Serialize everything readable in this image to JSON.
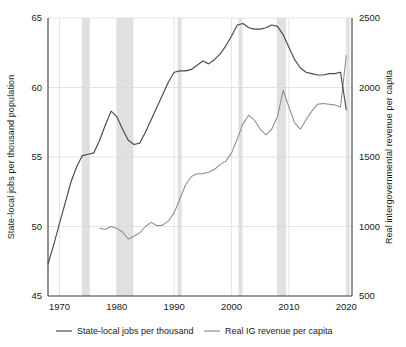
{
  "chart_data": {
    "type": "line",
    "title": "",
    "xlabel": "",
    "ylabel": "State-local jobs per thousand population",
    "y2label": "Real intergovernmental revenue per capita",
    "xlim": [
      1968,
      2021
    ],
    "ylim": [
      45,
      65
    ],
    "y2lim": [
      500,
      2500
    ],
    "grid": true,
    "legend_position": "bottom",
    "x_ticks": [
      1970,
      1980,
      1990,
      2000,
      2010,
      2020
    ],
    "y_ticks": [
      45,
      50,
      55,
      60,
      65
    ],
    "y2_ticks": [
      500,
      1000,
      1500,
      2000,
      2500
    ],
    "recession_bands": [
      {
        "start": 1973.9,
        "end": 1975.3
      },
      {
        "start": 1980.0,
        "end": 1982.9
      },
      {
        "start": 1990.6,
        "end": 1991.3
      },
      {
        "start": 2001.2,
        "end": 2001.9
      },
      {
        "start": 2007.9,
        "end": 2009.5
      },
      {
        "start": 2020.1,
        "end": 2020.6
      }
    ],
    "series": [
      {
        "name": "State-local jobs per thousand",
        "axis": "left",
        "color": "#4a4a4a",
        "x": [
          1968,
          1969,
          1970,
          1971,
          1972,
          1973,
          1974,
          1975,
          1976,
          1977,
          1978,
          1979,
          1980,
          1981,
          1982,
          1983,
          1984,
          1985,
          1986,
          1987,
          1988,
          1989,
          1990,
          1991,
          1992,
          1993,
          1994,
          1995,
          1996,
          1997,
          1998,
          1999,
          2000,
          2001,
          2002,
          2003,
          2004,
          2005,
          2006,
          2007,
          2008,
          2009,
          2010,
          2011,
          2012,
          2013,
          2014,
          2015,
          2016,
          2017,
          2018,
          2019,
          2020
        ],
        "values": [
          47.3,
          48.7,
          50.2,
          51.7,
          53.2,
          54.3,
          55.1,
          55.2,
          55.3,
          56.2,
          57.3,
          58.3,
          57.9,
          57.0,
          56.2,
          55.9,
          56.0,
          56.8,
          57.7,
          58.6,
          59.5,
          60.4,
          61.1,
          61.2,
          61.2,
          61.3,
          61.6,
          61.9,
          61.7,
          62.0,
          62.4,
          63.0,
          63.7,
          64.5,
          64.6,
          64.3,
          64.2,
          64.2,
          64.3,
          64.5,
          64.4,
          63.8,
          62.9,
          62.0,
          61.4,
          61.1,
          61.0,
          60.9,
          60.9,
          61.0,
          61.0,
          61.1,
          58.4
        ]
      },
      {
        "name": "Real IG revenue per capita",
        "axis": "right",
        "color": "#8c8c8c",
        "x": [
          1977,
          1978,
          1979,
          1980,
          1981,
          1982,
          1983,
          1984,
          1985,
          1986,
          1987,
          1988,
          1989,
          1990,
          1991,
          1992,
          1993,
          1994,
          1995,
          1996,
          1997,
          1998,
          1999,
          2000,
          2001,
          2002,
          2003,
          2004,
          2005,
          2006,
          2007,
          2008,
          2009,
          2010,
          2011,
          2012,
          2013,
          2014,
          2015,
          2016,
          2017,
          2018,
          2019,
          2020
        ],
        "values": [
          985,
          980,
          1000,
          985,
          960,
          910,
          930,
          955,
          1000,
          1030,
          1005,
          1010,
          1040,
          1100,
          1200,
          1300,
          1360,
          1380,
          1380,
          1390,
          1410,
          1445,
          1470,
          1530,
          1630,
          1740,
          1800,
          1765,
          1700,
          1660,
          1700,
          1790,
          1980,
          1860,
          1745,
          1700,
          1770,
          1830,
          1880,
          1885,
          1880,
          1875,
          1860,
          2230
        ]
      }
    ],
    "legend": [
      {
        "label": "State-local jobs per thousand",
        "color": "#4a4a4a"
      },
      {
        "label": "Real IG revenue per capita",
        "color": "#8c8c8c"
      }
    ]
  }
}
